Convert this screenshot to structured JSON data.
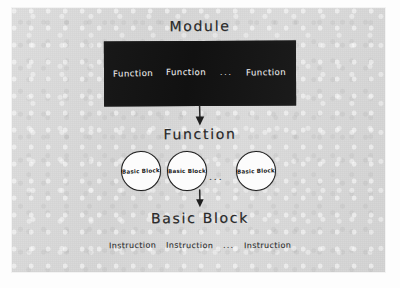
{
  "diagram": {
    "type": "hierarchy",
    "title": "Module",
    "background_color": "#d9d9d9",
    "ink_color": "#2b2b2b",
    "box_color": "#151515",
    "levels": [
      {
        "heading": "Module",
        "container": "black-box",
        "items": [
          "Function",
          "Function",
          "Function"
        ],
        "ellipsis": "..."
      },
      {
        "heading": "Function",
        "container": "circles",
        "items": [
          "Basic Block",
          "Basic Block",
          "Basic Block"
        ],
        "ellipsis": "..."
      },
      {
        "heading": "Basic Block",
        "container": "plain-text",
        "items": [
          "Instruction",
          "Instruction",
          "Instruction"
        ],
        "ellipsis": "..."
      }
    ]
  },
  "headings": {
    "module": "Module",
    "function": "Function",
    "basic_block": "Basic Block"
  },
  "module_box": {
    "function_1": "Function",
    "function_2": "Function",
    "ellipsis": "...",
    "function_3": "Function"
  },
  "basic_blocks": {
    "block_1": "Basic Block",
    "block_2": "Basic Block",
    "ellipsis": "...",
    "block_3": "Basic Block"
  },
  "instructions": {
    "instruction_1": "Instruction",
    "instruction_2": "Instruction",
    "ellipsis": "...",
    "instruction_3": "Instruction"
  },
  "arrows": {
    "module_to_function": "down-arrow",
    "function_to_basic_block": "down-arrow"
  }
}
